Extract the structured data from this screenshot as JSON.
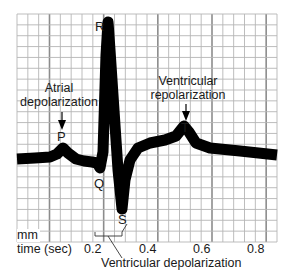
{
  "diagram": {
    "grid": {
      "x_left": 17,
      "x_right": 277,
      "y_top": 14,
      "y_bottom": 242,
      "minor_step": 10.8,
      "major_every": 5,
      "minor_color": "#b5b5b5",
      "major_color": "#8c8c8c"
    },
    "trace_color": "#000000",
    "labels": {
      "r": "R",
      "q": "Q",
      "s": "S",
      "p": "P",
      "t": "T",
      "atrial_line1": "Atrial",
      "atrial_line2": "depolarization",
      "vrepol_line1": "Ventricular",
      "vrepol_line2": "repolarization",
      "vdepol": "Ventricular depolarization",
      "mm": "mm",
      "time_axis": "time (sec)"
    },
    "x_ticks": [
      "0.2",
      "0.4",
      "0.6",
      "0.8"
    ]
  },
  "chart_data": {
    "type": "line",
    "xlabel": "time (sec)",
    "ylabel": "mm",
    "x_ticks": [
      0.2,
      0.4,
      0.6,
      0.8
    ],
    "waves": [
      {
        "name": "P",
        "event": "Atrial depolarization",
        "time_sec": 0.08
      },
      {
        "name": "Q",
        "time_sec": 0.21
      },
      {
        "name": "R",
        "time_sec": 0.24
      },
      {
        "name": "S",
        "time_sec": 0.32
      },
      {
        "name": "T",
        "event": "Ventricular repolarization",
        "time_sec": 0.55
      }
    ],
    "annotations": [
      "Atrial depolarization",
      "Ventricular repolarization",
      "Ventricular depolarization"
    ]
  }
}
